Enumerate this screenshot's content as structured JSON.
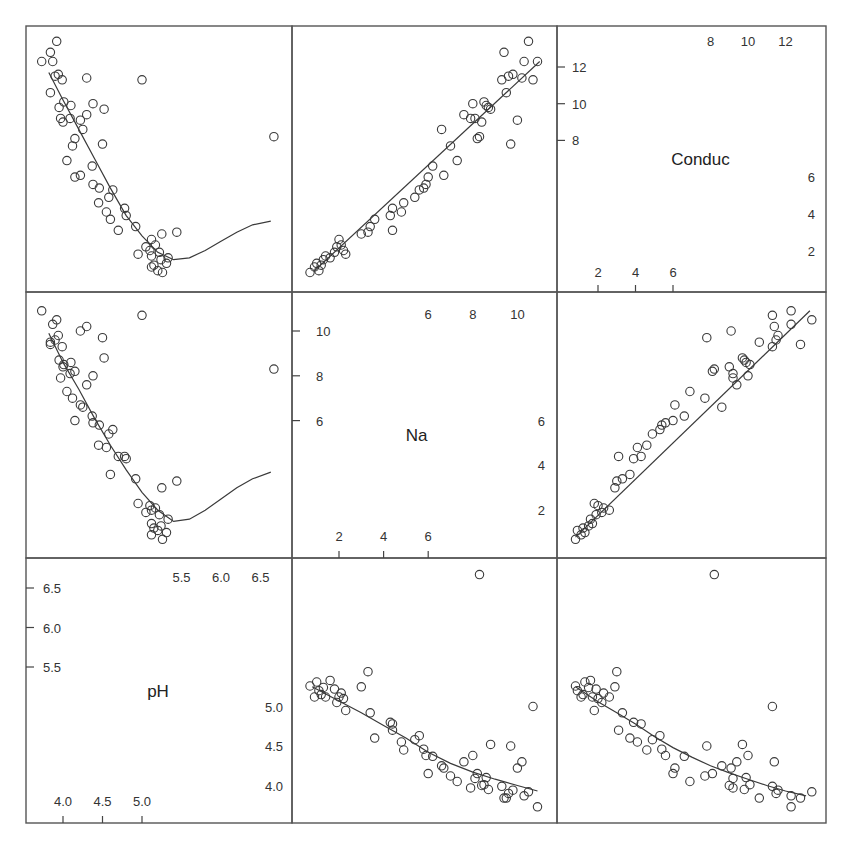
{
  "chart_data": {
    "type": "scatter",
    "layout": "scatterplot-matrix",
    "title": "",
    "variables": [
      "Conduc",
      "Na",
      "pH"
    ],
    "diagonal_labels": [
      "Conduc",
      "Na",
      "pH"
    ],
    "grid": false,
    "legend": null,
    "smoother": "loess",
    "axes": {
      "Conduc": {
        "range": [
          0.8,
          13.4
        ],
        "ticks_left": [
          8,
          10,
          12
        ],
        "ticks_top": [
          8,
          10,
          12
        ],
        "ticks_bottom": [
          2,
          4,
          6
        ],
        "ticks_right": [
          2,
          4,
          6
        ]
      },
      "Na": {
        "range": [
          0.6,
          11.0
        ],
        "ticks_left": [
          6,
          8,
          10
        ],
        "ticks_top": [
          6,
          8,
          10
        ],
        "ticks_bottom": [
          2,
          4,
          6
        ],
        "ticks_right": [
          2,
          4,
          6
        ]
      },
      "pH": {
        "range": [
          3.75,
          6.75
        ],
        "ticks_left": [
          5.5,
          6.0,
          6.5
        ],
        "ticks_top": [
          5.5,
          6.0,
          6.5
        ],
        "ticks_bottom": [
          4.0,
          4.5,
          5.0
        ],
        "ticks_right": [
          4.0,
          4.5,
          5.0
        ]
      }
    },
    "observations": [
      {
        "pH": 5.24,
        "Na": 1.3,
        "Conduc": 1.5
      },
      {
        "pH": 5.12,
        "Na": 0.9,
        "Conduc": 1.1
      },
      {
        "pH": 5.2,
        "Na": 1.1,
        "Conduc": 0.9
      },
      {
        "pH": 5.31,
        "Na": 1.0,
        "Conduc": 1.3
      },
      {
        "pH": 5.12,
        "Na": 1.4,
        "Conduc": 1.7
      },
      {
        "pH": 5.26,
        "Na": 0.7,
        "Conduc": 0.8
      },
      {
        "pH": 5.15,
        "Na": 1.2,
        "Conduc": 1.2
      },
      {
        "pH": 5.33,
        "Na": 1.6,
        "Conduc": 1.6
      },
      {
        "pH": 5.05,
        "Na": 1.9,
        "Conduc": 2.2
      },
      {
        "pH": 5.17,
        "Na": 2.1,
        "Conduc": 2.3
      },
      {
        "pH": 5.12,
        "Na": 2.0,
        "Conduc": 2.6
      },
      {
        "pH": 5.22,
        "Na": 1.8,
        "Conduc": 1.9
      },
      {
        "pH": 5.1,
        "Na": 2.2,
        "Conduc": 2.0
      },
      {
        "pH": 4.95,
        "Na": 2.3,
        "Conduc": 1.8
      },
      {
        "pH": 5.25,
        "Na": 3.0,
        "Conduc": 2.9
      },
      {
        "pH": 4.92,
        "Na": 3.4,
        "Conduc": 3.3
      },
      {
        "pH": 4.6,
        "Na": 3.6,
        "Conduc": 3.7
      },
      {
        "pH": 5.44,
        "Na": 3.3,
        "Conduc": 3.0
      },
      {
        "pH": 4.78,
        "Na": 4.4,
        "Conduc": 4.3
      },
      {
        "pH": 4.8,
        "Na": 4.3,
        "Conduc": 3.9
      },
      {
        "pH": 4.45,
        "Na": 4.9,
        "Conduc": 4.6
      },
      {
        "pH": 4.7,
        "Na": 4.4,
        "Conduc": 3.1
      },
      {
        "pH": 4.58,
        "Na": 5.4,
        "Conduc": 4.9
      },
      {
        "pH": 4.63,
        "Na": 5.6,
        "Conduc": 5.3
      },
      {
        "pH": 4.46,
        "Na": 5.8,
        "Conduc": 5.4
      },
      {
        "pH": 4.55,
        "Na": 4.8,
        "Conduc": 4.1
      },
      {
        "pH": 4.22,
        "Na": 6.7,
        "Conduc": 6.1
      },
      {
        "pH": 4.15,
        "Na": 6.0,
        "Conduc": 6.0
      },
      {
        "pH": 4.37,
        "Na": 6.2,
        "Conduc": 6.6
      },
      {
        "pH": 4.38,
        "Na": 5.9,
        "Conduc": 5.6
      },
      {
        "pH": 4.05,
        "Na": 7.3,
        "Conduc": 6.9
      },
      {
        "pH": 4.12,
        "Na": 7.0,
        "Conduc": 7.7
      },
      {
        "pH": 4.5,
        "Na": 9.7,
        "Conduc": 7.8
      },
      {
        "pH": 4.25,
        "Na": 6.6,
        "Conduc": 8.6
      },
      {
        "pH": 4.3,
        "Na": 7.6,
        "Conduc": 9.4
      },
      {
        "pH": 4.0,
        "Na": 8.4,
        "Conduc": 9.0
      },
      {
        "pH": 4.09,
        "Na": 8.1,
        "Conduc": 9.2
      },
      {
        "pH": 4.38,
        "Na": 8.0,
        "Conduc": 10.0
      },
      {
        "pH": 3.97,
        "Na": 7.9,
        "Conduc": 9.2
      },
      {
        "pH": 4.1,
        "Na": 8.6,
        "Conduc": 9.9
      },
      {
        "pH": 4.01,
        "Na": 8.5,
        "Conduc": 10.1
      },
      {
        "pH": 3.95,
        "Na": 8.7,
        "Conduc": 9.8
      },
      {
        "pH": 4.52,
        "Na": 8.8,
        "Conduc": 9.7
      },
      {
        "pH": 4.15,
        "Na": 8.2,
        "Conduc": 8.1
      },
      {
        "pH": 3.99,
        "Na": 9.3,
        "Conduc": 11.3
      },
      {
        "pH": 3.9,
        "Na": 9.6,
        "Conduc": 11.5
      },
      {
        "pH": 3.94,
        "Na": 9.8,
        "Conduc": 11.6
      },
      {
        "pH": 4.3,
        "Na": 10.2,
        "Conduc": 11.4
      },
      {
        "pH": 3.84,
        "Na": 9.4,
        "Conduc": 12.8
      },
      {
        "pH": 3.92,
        "Na": 10.5,
        "Conduc": 13.4
      },
      {
        "pH": 3.87,
        "Na": 10.3,
        "Conduc": 12.3
      },
      {
        "pH": 3.84,
        "Na": 9.5,
        "Conduc": 10.6
      },
      {
        "pH": 5.0,
        "Na": 10.7,
        "Conduc": 11.3
      },
      {
        "pH": 4.22,
        "Na": 10.0,
        "Conduc": 9.1
      },
      {
        "pH": 3.73,
        "Na": 10.9,
        "Conduc": 12.3
      },
      {
        "pH": 6.67,
        "Na": 8.3,
        "Conduc": 8.2
      }
    ],
    "smooth_curves": {
      "Conduc_vs_pH": [
        [
          3.82,
          11.7
        ],
        [
          4.0,
          10.2
        ],
        [
          4.2,
          8.6
        ],
        [
          4.4,
          7.0
        ],
        [
          4.6,
          5.4
        ],
        [
          4.8,
          3.9
        ],
        [
          5.0,
          2.8
        ],
        [
          5.2,
          1.9
        ],
        [
          5.4,
          1.5
        ],
        [
          5.6,
          1.6
        ],
        [
          5.8,
          2.0
        ],
        [
          6.0,
          2.5
        ],
        [
          6.2,
          3.0
        ],
        [
          6.4,
          3.4
        ],
        [
          6.63,
          3.6
        ]
      ],
      "Conduc_vs_Na": [
        [
          0.9,
          0.9
        ],
        [
          11.0,
          12.3
        ]
      ],
      "Na_vs_pH": [
        [
          3.82,
          9.9
        ],
        [
          4.0,
          8.6
        ],
        [
          4.2,
          7.4
        ],
        [
          4.4,
          6.1
        ],
        [
          4.6,
          4.9
        ],
        [
          4.8,
          3.8
        ],
        [
          5.0,
          2.8
        ],
        [
          5.2,
          2.0
        ],
        [
          5.4,
          1.5
        ],
        [
          5.6,
          1.6
        ],
        [
          5.8,
          2.0
        ],
        [
          6.0,
          2.5
        ],
        [
          6.2,
          3.0
        ],
        [
          6.4,
          3.4
        ],
        [
          6.63,
          3.7
        ]
      ],
      "Na_vs_Conduc": [
        [
          0.8,
          0.8
        ],
        [
          13.3,
          10.9
        ]
      ],
      "pH_vs_Na": [
        [
          0.8,
          5.25
        ],
        [
          2.0,
          5.07
        ],
        [
          3.0,
          4.92
        ],
        [
          4.0,
          4.76
        ],
        [
          5.0,
          4.6
        ],
        [
          6.0,
          4.42
        ],
        [
          7.0,
          4.28
        ],
        [
          8.0,
          4.17
        ],
        [
          9.0,
          4.08
        ],
        [
          10.0,
          4.0
        ],
        [
          10.9,
          3.93
        ]
      ],
      "pH_vs_Conduc": [
        [
          0.8,
          5.25
        ],
        [
          2.0,
          5.06
        ],
        [
          3.0,
          4.92
        ],
        [
          4.0,
          4.78
        ],
        [
          5.0,
          4.62
        ],
        [
          6.0,
          4.48
        ],
        [
          7.0,
          4.36
        ],
        [
          8.0,
          4.25
        ],
        [
          9.0,
          4.16
        ],
        [
          10.0,
          4.08
        ],
        [
          11.0,
          4.0
        ],
        [
          12.0,
          3.93
        ],
        [
          13.1,
          3.87
        ]
      ]
    }
  }
}
